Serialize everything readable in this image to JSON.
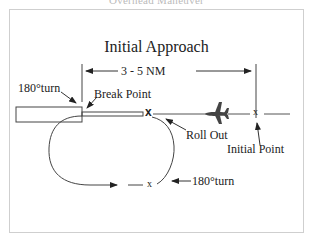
{
  "caption": "Overhead Maneuver",
  "title": "Initial Approach",
  "dimension_label": "3 - 5 NM",
  "labels": {
    "turn_top": "180°turn",
    "break_point": "Break Point",
    "roll_out": "Roll Out",
    "initial_point": "Initial Point",
    "turn_bottom": "180°turn"
  },
  "markers": {
    "break_x": "x",
    "initial_point_x": "x",
    "bottom_x": "x"
  },
  "icons": [
    "airplane-icon",
    "runway",
    "arrow-icon"
  ],
  "colors": {
    "line": "#333333",
    "frame": "#cfcfcf",
    "plane": "#444444"
  }
}
